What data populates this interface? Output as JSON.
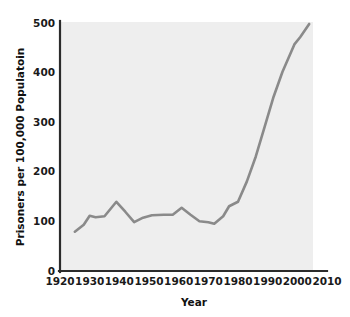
{
  "chart_data": {
    "type": "line",
    "title": "",
    "xlabel": "Year",
    "ylabel": "Prisoners per 100,000 Populatoin",
    "xlim": [
      1920,
      2010
    ],
    "ylim": [
      0,
      500
    ],
    "grid": false,
    "legend": null,
    "line_color": "#8a8a8a",
    "plot_background": "#eeeeee",
    "axis_color": "#2b2b2b",
    "xticks": [
      1920,
      1930,
      1940,
      1950,
      1960,
      1970,
      1980,
      1990,
      2000,
      2010
    ],
    "xtick_labels": [
      "1920",
      "1930",
      "1940",
      "1950",
      "1960",
      "1970",
      "1980",
      "1990",
      "2000",
      "2010"
    ],
    "yticks": [
      0,
      100,
      200,
      300,
      400,
      500
    ],
    "ytick_labels": [
      "0",
      "100",
      "200",
      "300",
      "400",
      "500"
    ],
    "series": [
      {
        "name": "Incarceration rate",
        "x": [
          1925,
          1928,
          1930,
          1932,
          1935,
          1939,
          1942,
          1945,
          1948,
          1951,
          1955,
          1958,
          1961,
          1964,
          1967,
          1970,
          1972,
          1975,
          1977,
          1980,
          1983,
          1986,
          1989,
          1992,
          1995,
          1999,
          2001,
          2004
        ],
        "values": [
          79,
          93,
          111,
          108,
          110,
          139,
          119,
          98,
          107,
          112,
          113,
          113,
          127,
          113,
          100,
          98,
          95,
          110,
          130,
          139,
          180,
          230,
          290,
          350,
          400,
          455,
          470,
          496
        ]
      }
    ]
  },
  "axis": {
    "ylabel": "Prisoners per 100,000 Populatoin",
    "xlabel": "Year"
  }
}
